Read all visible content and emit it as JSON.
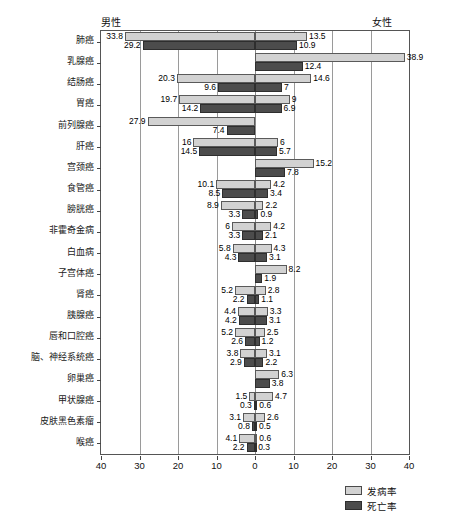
{
  "header": {
    "male_label": "男性",
    "female_label": "女性"
  },
  "legend": {
    "position": "bottom-right",
    "items": [
      {
        "label": "发病率",
        "color": "#d2d2d2",
        "key": "incidence"
      },
      {
        "label": "死亡率",
        "color": "#4c4c4c",
        "key": "mortality"
      }
    ]
  },
  "axis": {
    "ticks": [
      40,
      30,
      20,
      10,
      0,
      10,
      20,
      30,
      40
    ],
    "max": 40,
    "min": 0
  },
  "chart_data": {
    "type": "bar",
    "orientation": "horizontal",
    "subtype": "population-pyramid",
    "title": "",
    "subtitle": "",
    "xlabel": "",
    "ylabel": "",
    "xlim": [
      0,
      40
    ],
    "grid": true,
    "left_panel": "男性",
    "right_panel": "女性",
    "tick_labels": [
      "40",
      "30",
      "20",
      "10",
      "0",
      "10",
      "20",
      "30",
      "40"
    ],
    "legend_entries": [
      "发病率",
      "死亡率"
    ],
    "categories": [
      "肺癌",
      "乳腺癌",
      "结肠癌",
      "胃癌",
      "前列腺癌",
      "肝癌",
      "宫颈癌",
      "食管癌",
      "膀胱癌",
      "非霍奇金病",
      "白血病",
      "子宫体癌",
      "肾癌",
      "胰腺癌",
      "唇和口腔癌",
      "脑、神经系统癌",
      "卵巢癌",
      "甲状腺癌",
      "皮肤黑色素瘤",
      "喉癌"
    ],
    "series": [
      {
        "name": "男性发病率",
        "side": "left",
        "metric": "incidence",
        "values": [
          33.8,
          0,
          20.3,
          19.7,
          27.9,
          16,
          0,
          10.1,
          8.9,
          6,
          5.8,
          0,
          5.2,
          4.4,
          5.2,
          3.8,
          0,
          1.5,
          3.1,
          4.1
        ]
      },
      {
        "name": "男性死亡率",
        "side": "left",
        "metric": "mortality",
        "values": [
          29.2,
          0,
          9.6,
          14.2,
          7.4,
          14.5,
          0,
          8.5,
          3.3,
          3.3,
          4.3,
          0,
          2.2,
          4.2,
          2.6,
          2.9,
          0,
          0.3,
          0.8,
          2.2
        ]
      },
      {
        "name": "女性发病率",
        "side": "right",
        "metric": "incidence",
        "values": [
          13.5,
          38.9,
          14.6,
          9,
          0,
          6,
          15.2,
          4.2,
          2.2,
          4.2,
          4.3,
          8.2,
          2.8,
          3.3,
          2.5,
          3.1,
          6.3,
          4.7,
          2.6,
          0.6
        ]
      },
      {
        "name": "女性死亡率",
        "side": "right",
        "metric": "mortality",
        "values": [
          10.9,
          12.4,
          7,
          6.9,
          0,
          5.7,
          7.8,
          3.4,
          0.9,
          2.1,
          3.1,
          1.9,
          1.1,
          3.1,
          1.2,
          2.2,
          3.8,
          0.6,
          0.5,
          0.3
        ]
      }
    ]
  }
}
